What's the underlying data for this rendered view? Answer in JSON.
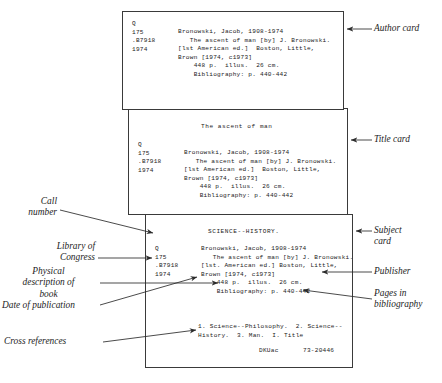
{
  "figure": {
    "type": "library-catalog-card-diagram"
  },
  "cards": {
    "author": {
      "name": "Author card",
      "call_number": "Q\n175\n.B7918\n1974",
      "body": "Bronowski, Jacob, 1908-1974\n   The ascent of man [by] J. Bronowski.\n[lst American ed.]  Boston, Little,\nBrown [1974, c1973]\n    448 p.  illus.  26 cm.\n    Bibliography: p. 440-442"
    },
    "title": {
      "name": "Title card",
      "heading": "The ascent of man",
      "call_number": "Q\n175\n.B7918\n1974",
      "body": "Bronowski, Jacob, 1908-1974\n   The ascent of man [by] J. Bronowski.\n[lst American ed.]  Boston, Little,\nBrown [1974, c1973]\n    448 p.  illus.  26 cm.\n    Bibliography: p. 440-442"
    },
    "subject": {
      "name": "Subject card",
      "heading": "SCIENCE--HISTORY.",
      "call_number": "Q\n175\n.B7918\n1974",
      "body": "Bronowski, Jacob, 1908-1974\n   The ascent of man [by] J. Bronowski.\n[lst. American ed.] Boston, Little,\nBrown [1974, c1973]\n    448 p.  illus.  26 cm.\n    Bibliography: p. 440-442",
      "tracings": "1. Science--Philosophy.  2. Science--\nHistory.  3. Man.  I. Title",
      "source_symbol": "DKUac",
      "lc_card_number": "73-20446"
    }
  },
  "annotations": {
    "author_card": "Author card",
    "title_card": "Title card",
    "subject_card": "Subject\ncard",
    "publisher": "Publisher",
    "pages_in_bibliography": "Pages in\nbibliography",
    "call_number": "Call\nnumber",
    "library_of_congress": "Library of\nCongress",
    "physical_description": "Physical\ndescription of\nbook",
    "date_of_publication": "Date of publication",
    "cross_references": "Cross references"
  },
  "colors": {
    "card_border": "#3a3a3a",
    "leader_line": "#2b2b2b",
    "text": "#1b1b1b",
    "background": "#ffffff"
  }
}
